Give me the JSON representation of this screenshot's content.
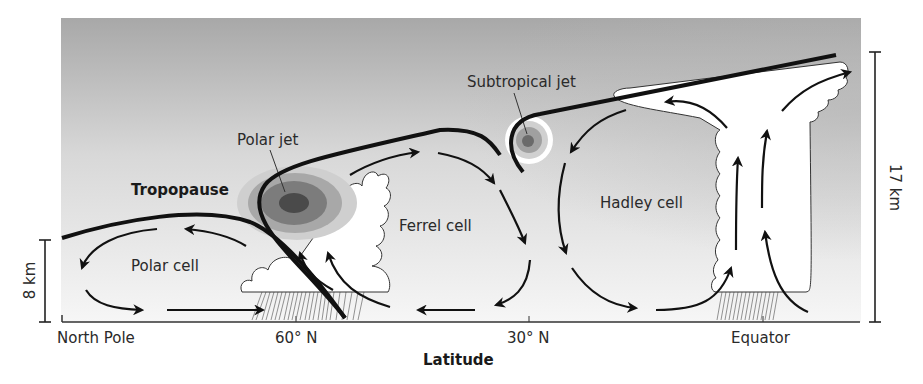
{
  "diagram": {
    "labels": {
      "tropopause": "Tropopause",
      "polar_jet": "Polar jet",
      "subtropical_jet": "Subtropical jet",
      "polar_cell": "Polar cell",
      "ferrel_cell": "Ferrel cell",
      "hadley_cell": "Hadley cell"
    },
    "x_axis": {
      "title": "Latitude",
      "ticks": [
        "North Pole",
        "60° N",
        "30° N",
        "Equator"
      ]
    },
    "scale_bars": {
      "left": "8 km",
      "right": "17 km"
    },
    "colors": {
      "sky_top": "#a9a9a9",
      "sky_bottom": "#f4f4f4",
      "line": "#111111",
      "cloud": "#ffffff",
      "jet_core": "#4a4a4a",
      "jet_outer": "#c8c8c8"
    }
  }
}
